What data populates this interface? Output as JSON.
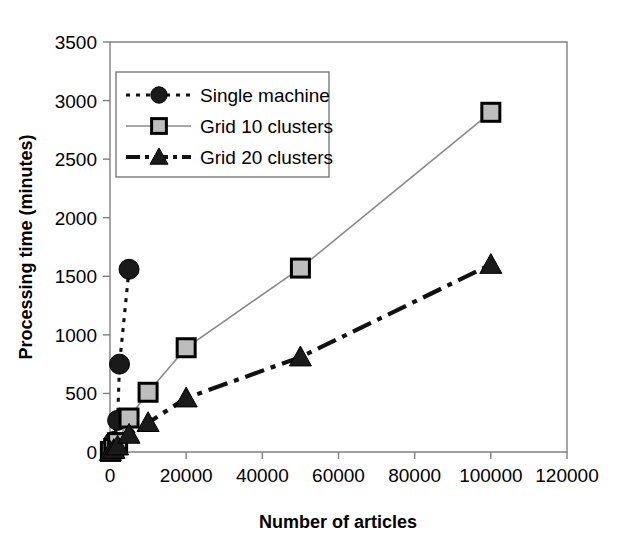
{
  "figure": {
    "page_top_text": "",
    "background": "#ffffff"
  },
  "chart_data": {
    "type": "line",
    "title": "",
    "xlabel": "Number of articles",
    "ylabel": "Processing time (minutes)",
    "xlim": [
      0,
      120000
    ],
    "ylim": [
      0,
      3500
    ],
    "xticks": [
      0,
      20000,
      40000,
      60000,
      80000,
      100000,
      120000
    ],
    "xtick_labels": [
      "0",
      "20000",
      "40000",
      "60000",
      "80000",
      "100000",
      "120000"
    ],
    "yticks": [
      0,
      500,
      1000,
      1500,
      2000,
      2500,
      3000,
      3500
    ],
    "ytick_labels": [
      "0",
      "500",
      "1000",
      "1500",
      "2000",
      "2500",
      "3000",
      "3500"
    ],
    "grid": false,
    "legend_position": "upper-left-inside",
    "series": [
      {
        "name": "Single machine",
        "marker": "circle",
        "line_style": "dotted",
        "color": "#1a1a1a",
        "x": [
          100,
          500,
          1000,
          2000,
          5000
        ],
        "y": [
          10,
          40,
          90,
          270,
          1560
        ],
        "points": [
          {
            "x": 100,
            "y": 10
          },
          {
            "x": 500,
            "y": 40
          },
          {
            "x": 1000,
            "y": 90
          },
          {
            "x": 2000,
            "y": 270
          },
          {
            "x": 2500,
            "y": 750
          },
          {
            "x": 5000,
            "y": 1560
          }
        ]
      },
      {
        "name": "Grid 10 clusters",
        "marker": "square",
        "line_style": "solid",
        "color": "#bdbdbd",
        "x": [
          100,
          1000,
          2000,
          5000,
          10000,
          20000,
          50000,
          100000
        ],
        "y": [
          5,
          30,
          80,
          290,
          510,
          890,
          1570,
          2900
        ],
        "points": [
          {
            "x": 100,
            "y": 5
          },
          {
            "x": 1000,
            "y": 30
          },
          {
            "x": 2000,
            "y": 80
          },
          {
            "x": 5000,
            "y": 290
          },
          {
            "x": 10000,
            "y": 510
          },
          {
            "x": 20000,
            "y": 890
          },
          {
            "x": 50000,
            "y": 1570
          },
          {
            "x": 100000,
            "y": 2900
          }
        ]
      },
      {
        "name": "Grid 20 clusters",
        "marker": "triangle",
        "line_style": "dash-dot",
        "color": "#1a1a1a",
        "x": [
          100,
          1000,
          2000,
          5000,
          10000,
          20000,
          50000,
          100000
        ],
        "y": [
          3,
          20,
          50,
          150,
          250,
          460,
          810,
          1600
        ],
        "points": [
          {
            "x": 100,
            "y": 3
          },
          {
            "x": 1000,
            "y": 20
          },
          {
            "x": 2000,
            "y": 50
          },
          {
            "x": 5000,
            "y": 150
          },
          {
            "x": 10000,
            "y": 250
          },
          {
            "x": 20000,
            "y": 460
          },
          {
            "x": 50000,
            "y": 810
          },
          {
            "x": 100000,
            "y": 1600
          }
        ]
      }
    ],
    "legend_entries": [
      {
        "label": "Single machine",
        "marker": "circle",
        "line_style": "dotted"
      },
      {
        "label": "Grid 10 clusters",
        "marker": "square",
        "line_style": "solid"
      },
      {
        "label": "Grid 20 clusters",
        "marker": "triangle",
        "line_style": "dash-dot"
      }
    ]
  }
}
